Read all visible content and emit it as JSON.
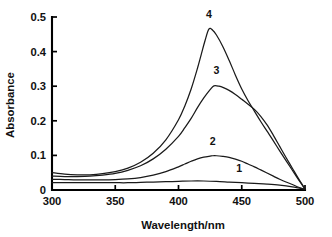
{
  "chart_data": {
    "type": "line",
    "title": "",
    "xlabel": "Wavelength/nm",
    "ylabel": "Absorbance",
    "xlim": [
      300,
      500
    ],
    "ylim": [
      0,
      0.5
    ],
    "xticks": [
      "300",
      "350",
      "400",
      "450",
      "500"
    ],
    "yticks": [
      "0",
      "0.1",
      "0.2",
      "0.3",
      "0.4",
      "0.5"
    ],
    "grid": false,
    "legend": "inline curve numbers",
    "series": [
      {
        "name": "1",
        "label": "1",
        "peak_x": 410,
        "peak_y": 0.026,
        "points": [
          [
            300,
            0.021
          ],
          [
            310,
            0.021
          ],
          [
            320,
            0.021
          ],
          [
            330,
            0.021
          ],
          [
            340,
            0.021
          ],
          [
            350,
            0.021
          ],
          [
            360,
            0.021
          ],
          [
            370,
            0.022
          ],
          [
            380,
            0.023
          ],
          [
            390,
            0.024
          ],
          [
            400,
            0.025
          ],
          [
            410,
            0.026
          ],
          [
            420,
            0.026
          ],
          [
            430,
            0.025
          ],
          [
            440,
            0.023
          ],
          [
            450,
            0.021
          ],
          [
            460,
            0.019
          ],
          [
            470,
            0.017
          ],
          [
            480,
            0.014
          ],
          [
            490,
            0.009
          ],
          [
            500,
            0.002
          ]
        ]
      },
      {
        "name": "2",
        "label": "2",
        "peak_x": 427,
        "peak_y": 0.099,
        "points": [
          [
            300,
            0.031
          ],
          [
            310,
            0.03
          ],
          [
            320,
            0.029
          ],
          [
            330,
            0.029
          ],
          [
            340,
            0.029
          ],
          [
            350,
            0.03
          ],
          [
            360,
            0.032
          ],
          [
            370,
            0.036
          ],
          [
            380,
            0.043
          ],
          [
            390,
            0.053
          ],
          [
            400,
            0.067
          ],
          [
            405,
            0.075
          ],
          [
            410,
            0.083
          ],
          [
            415,
            0.09
          ],
          [
            420,
            0.095
          ],
          [
            425,
            0.098
          ],
          [
            427,
            0.099
          ],
          [
            430,
            0.099
          ],
          [
            435,
            0.097
          ],
          [
            440,
            0.094
          ],
          [
            445,
            0.089
          ],
          [
            450,
            0.083
          ],
          [
            455,
            0.075
          ],
          [
            460,
            0.067
          ],
          [
            465,
            0.058
          ],
          [
            470,
            0.049
          ],
          [
            475,
            0.04
          ],
          [
            480,
            0.031
          ],
          [
            485,
            0.023
          ],
          [
            490,
            0.016
          ],
          [
            495,
            0.008
          ],
          [
            500,
            0.002
          ]
        ]
      },
      {
        "name": "3",
        "label": "3",
        "peak_x": 428,
        "peak_y": 0.301,
        "points": [
          [
            300,
            0.04
          ],
          [
            310,
            0.039
          ],
          [
            320,
            0.039
          ],
          [
            330,
            0.04
          ],
          [
            340,
            0.043
          ],
          [
            350,
            0.048
          ],
          [
            360,
            0.057
          ],
          [
            370,
            0.07
          ],
          [
            380,
            0.09
          ],
          [
            390,
            0.118
          ],
          [
            400,
            0.155
          ],
          [
            405,
            0.18
          ],
          [
            410,
            0.207
          ],
          [
            415,
            0.238
          ],
          [
            420,
            0.266
          ],
          [
            425,
            0.29
          ],
          [
            428,
            0.301
          ],
          [
            432,
            0.3
          ],
          [
            436,
            0.295
          ],
          [
            440,
            0.288
          ],
          [
            445,
            0.276
          ],
          [
            450,
            0.262
          ],
          [
            455,
            0.248
          ],
          [
            460,
            0.233
          ],
          [
            465,
            0.213
          ],
          [
            470,
            0.188
          ],
          [
            475,
            0.158
          ],
          [
            480,
            0.126
          ],
          [
            485,
            0.094
          ],
          [
            490,
            0.063
          ],
          [
            495,
            0.032
          ],
          [
            500,
            0.003
          ]
        ]
      },
      {
        "name": "4",
        "label": "4",
        "peak_x": 424,
        "peak_y": 0.465,
        "points": [
          [
            300,
            0.05
          ],
          [
            310,
            0.046
          ],
          [
            320,
            0.044
          ],
          [
            330,
            0.044
          ],
          [
            340,
            0.047
          ],
          [
            350,
            0.053
          ],
          [
            360,
            0.063
          ],
          [
            370,
            0.08
          ],
          [
            380,
            0.106
          ],
          [
            390,
            0.145
          ],
          [
            400,
            0.203
          ],
          [
            405,
            0.243
          ],
          [
            410,
            0.292
          ],
          [
            415,
            0.352
          ],
          [
            418,
            0.392
          ],
          [
            421,
            0.432
          ],
          [
            424,
            0.465
          ],
          [
            427,
            0.462
          ],
          [
            430,
            0.448
          ],
          [
            435,
            0.415
          ],
          [
            440,
            0.375
          ],
          [
            445,
            0.332
          ],
          [
            450,
            0.292
          ],
          [
            455,
            0.258
          ],
          [
            460,
            0.228
          ],
          [
            465,
            0.198
          ],
          [
            470,
            0.17
          ],
          [
            475,
            0.142
          ],
          [
            480,
            0.113
          ],
          [
            485,
            0.085
          ],
          [
            490,
            0.057
          ],
          [
            495,
            0.029
          ],
          [
            500,
            0.003
          ]
        ]
      }
    ],
    "curve_labels": [
      {
        "text": "4",
        "x": 424,
        "y": 0.497
      },
      {
        "text": "3",
        "x": 430,
        "y": 0.335
      },
      {
        "text": "2",
        "x": 427,
        "y": 0.131
      },
      {
        "text": "1",
        "x": 448,
        "y": 0.052
      }
    ]
  },
  "colors": {
    "background": "#ffffff",
    "axis": "#000000",
    "curve": "#1a1a1a",
    "text": "#111111"
  }
}
